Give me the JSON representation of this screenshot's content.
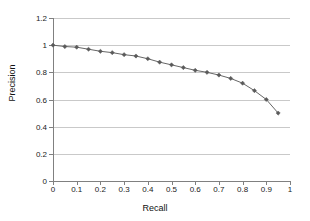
{
  "chart_data": {
    "type": "line",
    "title": "",
    "xlabel": "Recall",
    "ylabel": "Precision",
    "xlim": [
      0,
      1
    ],
    "ylim": [
      0,
      1.2
    ],
    "xticks": [
      "0",
      "0.1",
      "0.2",
      "0.3",
      "0.4",
      "0.5",
      "0.6",
      "0.7",
      "0.8",
      "0.9",
      "1"
    ],
    "xtick_values": [
      0,
      0.1,
      0.2,
      0.3,
      0.4,
      0.5,
      0.6,
      0.7,
      0.8,
      0.9,
      1
    ],
    "yticks": [
      "0",
      "0.2",
      "0.4",
      "0.6",
      "0.8",
      "1",
      "1.2"
    ],
    "ytick_values": [
      0,
      0.2,
      0.4,
      0.6,
      0.8,
      1,
      1.2
    ],
    "grid": "horizontal",
    "legend": "none",
    "marker": "diamond",
    "series_color": "#666666",
    "marker_color": "#5a5a5a",
    "grid_color": "#c9c9c9",
    "axis_color": "#808080",
    "x": [
      0,
      0.05,
      0.1,
      0.15,
      0.2,
      0.25,
      0.3,
      0.35,
      0.4,
      0.45,
      0.5,
      0.55,
      0.6,
      0.65,
      0.7,
      0.75,
      0.8,
      0.85,
      0.9,
      0.95
    ],
    "values": [
      1.0,
      0.99,
      0.985,
      0.97,
      0.955,
      0.945,
      0.93,
      0.92,
      0.9,
      0.875,
      0.855,
      0.835,
      0.815,
      0.8,
      0.78,
      0.755,
      0.72,
      0.665,
      0.6,
      0.5
    ]
  }
}
